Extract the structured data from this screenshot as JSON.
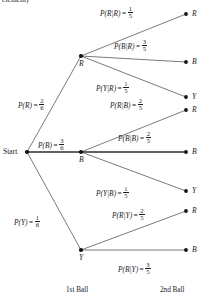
{
  "diagram": {
    "title_fragment": "element)",
    "stage_labels": {
      "first": "1st Ball",
      "second": "2nd Ball"
    },
    "start_label": "Start",
    "nodes": {
      "start": "Start",
      "first_red": "R",
      "first_blue": "B",
      "first_yellow": "Y",
      "rr": "R",
      "rb": "B",
      "ry": "Y",
      "br": "R",
      "bb": "B",
      "by": "Y",
      "yr": "R",
      "yb": "B"
    },
    "branches": {
      "p_r": {
        "expr": "P(R)",
        "eq": "=",
        "num": "2",
        "den": "6"
      },
      "p_b": {
        "expr": "P(B)",
        "eq": "=",
        "num": "3",
        "den": "6"
      },
      "p_y": {
        "expr": "P(Y)",
        "eq": "=",
        "num": "1",
        "den": "6"
      },
      "p_r_given_r": {
        "expr": "P(R|R)",
        "eq": "=",
        "num": "1",
        "den": "5"
      },
      "p_b_given_r": {
        "expr": "P(B|R)",
        "eq": "=",
        "num": "3",
        "den": "5"
      },
      "p_y_given_r": {
        "expr": "P(Y|R)",
        "eq": "=",
        "num": "1",
        "den": "5"
      },
      "p_r_given_b": {
        "expr": "P(R|B)",
        "eq": "=",
        "num": "2",
        "den": "5"
      },
      "p_b_given_b": {
        "expr": "P(B|B)",
        "eq": "=",
        "num": "2",
        "den": "5"
      },
      "p_y_given_b": {
        "expr": "P(Y|B)",
        "eq": "=",
        "num": "1",
        "den": "5"
      },
      "p_r_given_y": {
        "expr": "P(R|Y)",
        "eq": "=",
        "num": "2",
        "den": "5"
      },
      "p_b_given_y": {
        "expr": "P(B|Y)",
        "eq": "=",
        "num": "3",
        "den": "5"
      }
    }
  }
}
